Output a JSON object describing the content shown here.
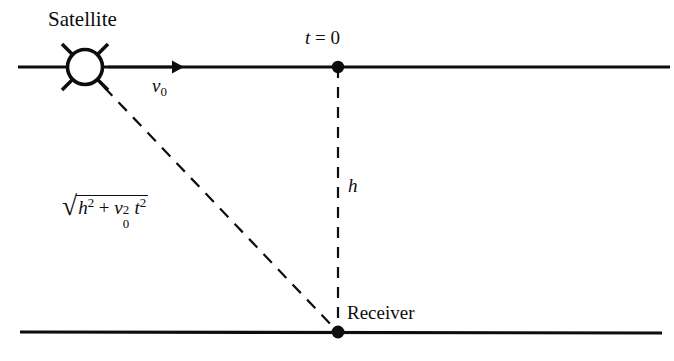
{
  "figure": {
    "type": "physics-diagram",
    "background_color": "#ffffff",
    "stroke_color": "#0d0d0d",
    "width": 674,
    "height": 361
  },
  "labels": {
    "satellite": "Satellite",
    "time_zero": "t = 0",
    "time_zero_var": "t",
    "time_zero_eq": "=",
    "time_zero_val": "0",
    "velocity": "v0",
    "velocity_var": "v",
    "velocity_sub": "0",
    "height": "h",
    "receiver": "Receiver",
    "slant_range": "sqrt(h^2 + v0^2 t^2)",
    "radical_sign": "√",
    "h_var": "h",
    "h_exp": "2",
    "plus": "+",
    "v_var": "v",
    "v_sub": "0",
    "v_exp": "2",
    "t_var": "t",
    "t_exp": "2"
  },
  "geometry": {
    "satellite_center": {
      "x": 85,
      "y": 67
    },
    "satellite_radius": 18,
    "satellite_spikes": 4,
    "top_line": {
      "x1": 18,
      "y1": 67,
      "x2": 670,
      "y2": 67
    },
    "bottom_line": {
      "x1": 20,
      "y1": 332,
      "x2": 662,
      "y2": 333
    },
    "arrow": {
      "x1": 108,
      "y1": 67,
      "x2": 182,
      "y2": 67
    },
    "vertical_dashed": {
      "x1": 338,
      "y1": 67,
      "x2": 338,
      "y2": 332
    },
    "diagonal_dashed": {
      "x1": 104,
      "y1": 87,
      "x2": 337,
      "y2": 331
    },
    "dot_t0": {
      "x": 338,
      "y": 67,
      "r": 6
    },
    "dot_receiver": {
      "x": 338,
      "y": 332,
      "r": 6
    }
  }
}
